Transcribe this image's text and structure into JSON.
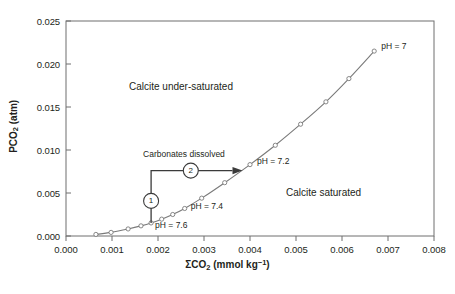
{
  "chart_data": {
    "type": "line",
    "title": "",
    "xlabel": "ΣCO2 (mmol kg-1)",
    "ylabel": "PCO2 (atm)",
    "xlabel_parts": {
      "pre": "ΣCO",
      "sub": "2",
      "mid": " (mmol kg",
      "sup": "−1",
      "post": ")"
    },
    "ylabel_parts": {
      "pre": "PCO",
      "sub": "2",
      "post": " (atm)"
    },
    "xlim": [
      0.0,
      0.008
    ],
    "ylim": [
      0.0,
      0.025
    ],
    "xticks": [
      "0.000",
      "0.001",
      "0.002",
      "0.003",
      "0.004",
      "0.005",
      "0.006",
      "0.007",
      "0.008"
    ],
    "xtick_values": [
      0.0,
      0.001,
      0.002,
      0.003,
      0.004,
      0.005,
      0.006,
      0.007,
      0.008
    ],
    "yticks": [
      "0.000",
      "0.005",
      "0.010",
      "0.015",
      "0.020",
      "0.025"
    ],
    "ytick_values": [
      0.0,
      0.005,
      0.01,
      0.015,
      0.02,
      0.025
    ],
    "grid": false,
    "legend": "none",
    "series": [
      {
        "name": "PCO2 vs ΣCO2 titration curve",
        "marker": "open-circle",
        "x": [
          0.00065,
          0.00098,
          0.00135,
          0.00163,
          0.00185,
          0.00208,
          0.00232,
          0.00258,
          0.00295,
          0.00345,
          0.004,
          0.00455,
          0.0051,
          0.00565,
          0.00615,
          0.0067
        ],
        "y": [
          0.00018,
          0.00042,
          0.00082,
          0.00118,
          0.00152,
          0.00196,
          0.0025,
          0.0032,
          0.0044,
          0.0062,
          0.0083,
          0.01055,
          0.013,
          0.0156,
          0.0183,
          0.0215
        ]
      }
    ],
    "point_annotations": [
      {
        "label": "pH = 7.6",
        "x": 0.00185,
        "y": 0.00152
      },
      {
        "label": "pH = 7.4",
        "x": 0.00258,
        "y": 0.0032
      },
      {
        "label": "pH = 7.2",
        "x": 0.004,
        "y": 0.0083
      },
      {
        "label": "pH = 7",
        "x": 0.0067,
        "y": 0.0215
      }
    ],
    "region_annotations": [
      {
        "label": "Calcite under-saturated",
        "x": 0.0025,
        "y": 0.0172
      },
      {
        "label": "Calcite saturated",
        "x": 0.0056,
        "y": 0.0049
      }
    ],
    "process_annotation": {
      "label": "Carbonates dissolved",
      "step_one": "1",
      "step_two": "2",
      "start": {
        "x": 0.00185,
        "y": 0.00152
      },
      "corner": {
        "x": 0.00185,
        "y": 0.0076
      },
      "end": {
        "x": 0.00375,
        "y": 0.0076
      }
    },
    "caption": ""
  }
}
